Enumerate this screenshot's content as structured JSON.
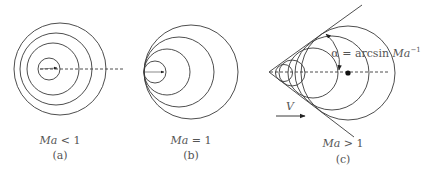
{
  "panels": [
    {
      "id": "a",
      "condition": "Ma < 1",
      "condition_var": "Ma",
      "condition_op": " < 1",
      "caption": "(a)"
    },
    {
      "id": "b",
      "condition": "Ma = 1",
      "condition_var": "Ma",
      "condition_op": " = 1",
      "caption": "(b)"
    },
    {
      "id": "c",
      "condition": "Ma > 1",
      "condition_var": "Ma",
      "condition_op": " > 1",
      "caption": "(c)",
      "angle_label_prefix": "α = arcsin ",
      "angle_label_var": "Ma",
      "angle_label_exp": "−1",
      "velocity_label": "V"
    }
  ],
  "colors": {
    "stroke": "#3a3a3a",
    "text": "#555555",
    "background": "#ffffff"
  }
}
